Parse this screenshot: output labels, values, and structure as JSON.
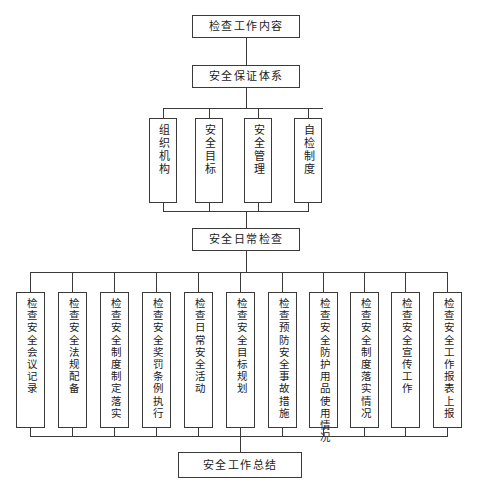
{
  "diagram": {
    "title_box": {
      "label": "检查工作内容"
    },
    "system_box": {
      "label": "安全保证体系"
    },
    "system_children": [
      {
        "label": "组织机构"
      },
      {
        "label": "安全目标"
      },
      {
        "label": "安全管理"
      },
      {
        "label": "自检制度"
      }
    ],
    "daily_box": {
      "label": "安全日常检查"
    },
    "daily_children": [
      {
        "label": "检查安全会议记录"
      },
      {
        "label": "检查安全法规配备"
      },
      {
        "label": "检查安全制度制定落实"
      },
      {
        "label": "检查安全奖罚条例执行"
      },
      {
        "label": "检查日常安全活动"
      },
      {
        "label": "检查安全目标规划"
      },
      {
        "label": "检查预防安全事故措施"
      },
      {
        "label": "检查安全防护用品使用情况"
      },
      {
        "label": "检查安全制度落实情况"
      },
      {
        "label": "检查安全宣传工作"
      },
      {
        "label": "检查安全工作报表上报"
      }
    ],
    "summary_box": {
      "label": "安全工作总结"
    },
    "colors": {
      "stroke": "#3a3a3a",
      "background": "#ffffff",
      "text": "#1a1a1a"
    }
  }
}
